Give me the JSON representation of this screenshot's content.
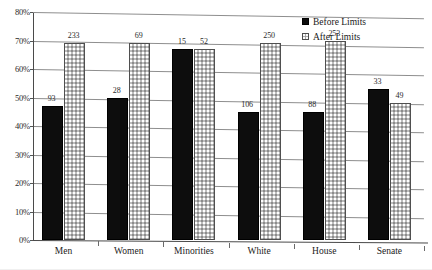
{
  "chart_data": {
    "type": "bar",
    "title": "",
    "subtitle": "",
    "xlabel": "",
    "ylabel": "",
    "ylim": [
      0,
      80
    ],
    "ytick_labels": [
      "0%",
      "10%",
      "20%",
      "30%",
      "40%",
      "50%",
      "60%",
      "70%",
      "80%"
    ],
    "ytick_values": [
      0,
      10,
      20,
      30,
      40,
      50,
      60,
      70,
      80
    ],
    "grid": true,
    "legend_position": "top-right-inside",
    "categories": [
      "Men",
      "Women",
      "Minorities",
      "White",
      "House",
      "Senate"
    ],
    "series": [
      {
        "name": "Before Limits",
        "swatch": "solid-black",
        "color": "#0d0d0d",
        "values": [
          47,
          50,
          67,
          45,
          45,
          53
        ],
        "labels": [
          "93",
          "28",
          "15",
          "106",
          "88",
          "33"
        ]
      },
      {
        "name": "After Limits",
        "swatch": "dotted-gray",
        "color": "#bdbdbd",
        "values": [
          69,
          69,
          67,
          69,
          70,
          48
        ],
        "labels": [
          "233",
          "69",
          "52",
          "250",
          "253",
          "49"
        ]
      }
    ]
  },
  "legend": {
    "items": [
      {
        "label": "Before Limits"
      },
      {
        "label": "After Limits"
      }
    ]
  }
}
